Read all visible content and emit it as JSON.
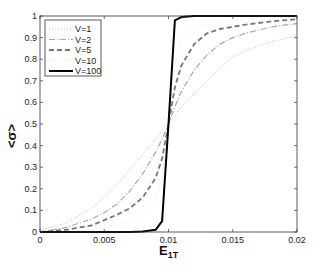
{
  "chart_data": {
    "type": "line",
    "title": "",
    "xlabel": "E",
    "xlabel_sub": "1T",
    "ylabel": "<σ>",
    "xlim": [
      0,
      0.02
    ],
    "ylim": [
      0,
      1
    ],
    "grid": false,
    "legend_position": "upper left",
    "x_ticks": [
      0,
      0.005,
      0.01,
      0.015,
      0.02
    ],
    "x_tick_labels": [
      "0",
      "0.005",
      "0.01",
      "0.015",
      "0.02"
    ],
    "y_ticks": [
      0,
      0.1,
      0.2,
      0.3,
      0.4,
      0.5,
      0.6,
      0.7,
      0.8,
      0.9,
      1
    ],
    "y_tick_labels": [
      "0",
      "0.1",
      "0.2",
      "0.3",
      "0.4",
      "0.5",
      "0.6",
      "0.7",
      "0.8",
      "0.9",
      "1"
    ],
    "x": [
      0,
      0.002,
      0.004,
      0.005,
      0.006,
      0.007,
      0.008,
      0.009,
      0.0095,
      0.01,
      0.0105,
      0.011,
      0.012,
      0.013,
      0.014,
      0.015,
      0.016,
      0.018,
      0.02
    ],
    "series": [
      {
        "name": "V=1",
        "style": "dotted",
        "color": "#b8b8b8",
        "width": 1,
        "values": [
          0.01,
          0.04,
          0.11,
          0.16,
          0.22,
          0.29,
          0.36,
          0.43,
          0.47,
          0.5,
          0.54,
          0.58,
          0.64,
          0.7,
          0.76,
          0.81,
          0.84,
          0.88,
          0.91
        ]
      },
      {
        "name": "V=2",
        "style": "dashdot",
        "color": "#a8a8a8",
        "width": 1.2,
        "values": [
          0.0,
          0.02,
          0.06,
          0.09,
          0.13,
          0.19,
          0.27,
          0.37,
          0.43,
          0.5,
          0.58,
          0.65,
          0.75,
          0.82,
          0.87,
          0.9,
          0.92,
          0.95,
          0.965
        ]
      },
      {
        "name": "V=5",
        "style": "dashed",
        "color": "#777777",
        "width": 1.8,
        "values": [
          0.0,
          0.01,
          0.03,
          0.055,
          0.08,
          0.11,
          0.16,
          0.25,
          0.34,
          0.5,
          0.67,
          0.77,
          0.87,
          0.92,
          0.94,
          0.95,
          0.96,
          0.975,
          0.985
        ]
      },
      {
        "name": "V=10",
        "style": "dotted",
        "color": "#e6e6e6",
        "width": 1,
        "values": [
          0.0,
          0.0,
          0.01,
          0.02,
          0.03,
          0.05,
          0.08,
          0.15,
          0.25,
          0.5,
          0.78,
          0.88,
          0.94,
          0.96,
          0.97,
          0.98,
          0.985,
          0.99,
          0.995
        ]
      },
      {
        "name": "V=100",
        "style": "solid",
        "color": "#000000",
        "width": 2,
        "values": [
          0.0,
          0.0,
          0.0,
          0.0,
          0.0,
          0.0,
          0.002,
          0.01,
          0.05,
          0.5,
          0.98,
          0.995,
          1.0,
          1.0,
          1.0,
          1.0,
          1.0,
          1.0,
          1.0
        ]
      }
    ]
  }
}
